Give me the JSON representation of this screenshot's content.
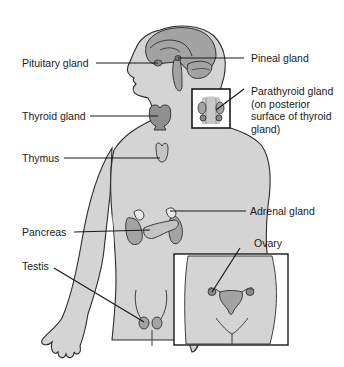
{
  "figure": {
    "colors": {
      "body_fill": "#d4d4d4",
      "organ_fill": "#a3a3a3",
      "organ_light": "#e8e8e8",
      "outline": "#2b2b2b",
      "leader_line": "#1a1a1a",
      "text": "#1a1a1a"
    }
  },
  "labels": {
    "pituitary": "Pituitary gland",
    "pineal": "Pineal gland",
    "parathyroid": "Parathyroid gland (on posterior surface of thyroid gland)",
    "thyroid": "Thyroid gland",
    "thymus": "Thymus",
    "adrenal": "Adrenal gland",
    "pancreas": "Pancreas",
    "ovary": "Ovary",
    "testis": "Testis"
  },
  "insets": [
    {
      "name": "parathyroid-inset",
      "content": "posterior view of thyroid with parathyroid glands"
    },
    {
      "name": "female-pelvis-inset",
      "content": "female pelvis showing ovaries and uterus"
    }
  ]
}
